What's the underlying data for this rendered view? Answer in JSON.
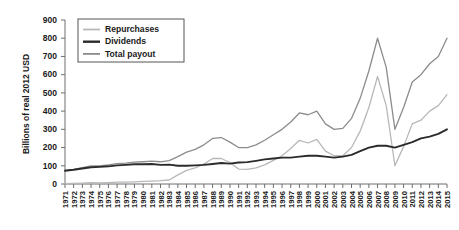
{
  "chart_data": {
    "type": "line",
    "title": "",
    "xlabel": "",
    "ylabel": "Billions of real 2012 USD",
    "ylim": [
      0,
      900
    ],
    "yticks": [
      0,
      100,
      200,
      300,
      400,
      500,
      600,
      700,
      800,
      900
    ],
    "grid": false,
    "legend_position": "top-left",
    "x": [
      1971,
      1972,
      1973,
      1974,
      1975,
      1976,
      1977,
      1978,
      1979,
      1980,
      1981,
      1982,
      1983,
      1984,
      1985,
      1986,
      1987,
      1988,
      1989,
      1990,
      1991,
      1992,
      1993,
      1994,
      1995,
      1996,
      1997,
      1998,
      1999,
      2000,
      2001,
      2002,
      2003,
      2004,
      2005,
      2006,
      2007,
      2008,
      2009,
      2010,
      2011,
      2012,
      2013,
      2014,
      2015
    ],
    "xtick_labels": [
      "1971",
      "1972",
      "1973",
      "1974",
      "1975",
      "1976",
      "1977",
      "1978",
      "1979",
      "1980",
      "1981",
      "1982",
      "1983",
      "1984",
      "1985",
      "1986",
      "1987",
      "1988",
      "1989",
      "1990",
      "1991",
      "1992",
      "1993",
      "1994",
      "1995",
      "1996",
      "1997",
      "1998",
      "1999",
      "2000",
      "2001",
      "2002",
      "2003",
      "2004",
      "2005",
      "2006",
      "2007",
      "2008",
      "2009",
      "2010",
      "2011",
      "2012",
      "2013",
      "2014",
      "2015"
    ],
    "series": [
      {
        "name": "Total payout",
        "color": "#8c8c8c",
        "width": 1.3,
        "values": [
          75,
          80,
          90,
          100,
          100,
          105,
          112,
          115,
          120,
          122,
          125,
          122,
          128,
          150,
          175,
          190,
          215,
          250,
          255,
          230,
          200,
          200,
          215,
          240,
          270,
          300,
          340,
          390,
          380,
          400,
          330,
          300,
          305,
          360,
          470,
          620,
          800,
          640,
          300,
          420,
          560,
          600,
          660,
          700,
          800
        ]
      },
      {
        "name": "Repurchases",
        "color": "#b8b8b8",
        "width": 1.3,
        "values": [
          2,
          3,
          5,
          8,
          6,
          8,
          10,
          10,
          12,
          14,
          16,
          18,
          22,
          50,
          75,
          88,
          110,
          140,
          140,
          118,
          82,
          80,
          88,
          105,
          130,
          155,
          195,
          240,
          225,
          245,
          180,
          155,
          155,
          200,
          290,
          420,
          590,
          430,
          100,
          205,
          330,
          350,
          400,
          430,
          490
        ]
      },
      {
        "name": "Dividends",
        "color": "#2b2b2b",
        "width": 1.9,
        "values": [
          73,
          78,
          85,
          92,
          94,
          97,
          102,
          105,
          108,
          108,
          110,
          105,
          106,
          100,
          100,
          102,
          105,
          110,
          115,
          112,
          118,
          120,
          127,
          135,
          140,
          145,
          145,
          150,
          155,
          155,
          150,
          145,
          150,
          160,
          180,
          200,
          210,
          210,
          200,
          215,
          230,
          250,
          260,
          275,
          300
        ]
      }
    ]
  },
  "legend": {
    "items": [
      {
        "label": "Repurchases"
      },
      {
        "label": "Dividends"
      },
      {
        "label": "Total payout"
      }
    ]
  },
  "axes": {
    "y_title": "Billions of real 2012 USD"
  }
}
